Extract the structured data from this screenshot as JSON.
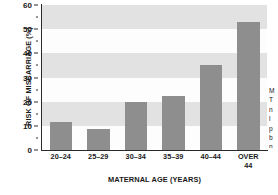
{
  "chart_data": {
    "type": "bar",
    "title": "",
    "subtitle": "",
    "xlabel": "MATERNAL AGE (YEARS)",
    "ylabel": "RISK OF MISCARRIAGE (%)",
    "categories": [
      "20–24",
      "25–29",
      "30–34",
      "35–39",
      "40–44",
      "OVER\n44"
    ],
    "values": [
      11.5,
      8.7,
      20,
      22.5,
      35,
      53
    ],
    "ylim": [
      0,
      60
    ],
    "yticks": [
      0,
      10,
      20,
      30,
      40,
      50,
      60
    ],
    "ytick_labels": [
      "0",
      "10",
      "20",
      "30",
      "40",
      "50",
      "60"
    ],
    "yminor_ticks": [
      5,
      15,
      25,
      35,
      45,
      55
    ],
    "grid": false,
    "bands": true,
    "legend": null,
    "legend_position": "none",
    "series": [
      {
        "name": "Risk of miscarriage",
        "values": [
          11.5,
          8.7,
          20,
          22.5,
          35,
          53
        ]
      }
    ],
    "colors": {
      "bar": "#8e8e8e",
      "band": "#e2e2e2",
      "plot_background": "#fdfdfd",
      "axis": "#2a2a2a",
      "text": "#1a1a1a"
    }
  },
  "side_caption": {
    "lines": [
      "M",
      "T",
      "n",
      "l",
      "p",
      "b",
      "n",
      "c"
    ]
  }
}
